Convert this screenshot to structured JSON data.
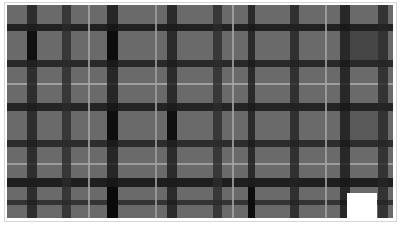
{
  "image": {
    "subject": "grayscale tartan plaid fabric",
    "background": "#ffffff",
    "border_color": "#d6d6d6",
    "base_color": "#6a6a6a",
    "vertical_bands": [
      {
        "x": 20,
        "w": 10,
        "color": "#1e1e1e"
      },
      {
        "x": 55,
        "w": 9,
        "color": "#2a2a2a"
      },
      {
        "x": 81,
        "w": 2,
        "color": "#a8a8a8"
      },
      {
        "x": 100,
        "w": 11,
        "color": "#151515"
      },
      {
        "x": 148,
        "w": 2,
        "color": "#a0a0a0"
      },
      {
        "x": 160,
        "w": 10,
        "color": "#1b1b1b"
      },
      {
        "x": 206,
        "w": 9,
        "color": "#2c2c2c"
      },
      {
        "x": 225,
        "w": 2,
        "color": "#a8a8a8"
      },
      {
        "x": 241,
        "w": 7,
        "color": "#1a1a1a"
      },
      {
        "x": 283,
        "w": 9,
        "color": "#222222"
      },
      {
        "x": 318,
        "w": 2,
        "color": "#a4a4a4"
      },
      {
        "x": 333,
        "w": 10,
        "color": "#181818"
      },
      {
        "x": 371,
        "w": 10,
        "color": "#262626"
      }
    ],
    "horizontal_bands": [
      {
        "y": 19,
        "h": 7,
        "color": "#141414"
      },
      {
        "y": 55,
        "h": 7,
        "color": "#1d1d1d"
      },
      {
        "y": 78,
        "h": 2,
        "color": "#a8a8a8"
      },
      {
        "y": 98,
        "h": 8,
        "color": "#171717"
      },
      {
        "y": 135,
        "h": 7,
        "color": "#222222"
      },
      {
        "y": 158,
        "h": 2,
        "color": "#a4a4a4"
      },
      {
        "y": 173,
        "h": 9,
        "color": "#111111"
      },
      {
        "y": 195,
        "h": 5,
        "color": "#2a2a2a"
      }
    ],
    "dark_blocks": [
      {
        "x": 20,
        "y": 26,
        "w": 10,
        "h": 29,
        "color": "#101010"
      },
      {
        "x": 100,
        "y": 26,
        "w": 11,
        "h": 29,
        "color": "#0c0c0c"
      },
      {
        "x": 100,
        "y": 106,
        "w": 11,
        "h": 29,
        "color": "#0e0e0e"
      },
      {
        "x": 160,
        "y": 106,
        "w": 10,
        "h": 29,
        "color": "#0f0f0f"
      },
      {
        "x": 100,
        "y": 182,
        "w": 11,
        "h": 31,
        "color": "#0a0a0a"
      },
      {
        "x": 241,
        "y": 182,
        "w": 7,
        "h": 31,
        "color": "#0d0d0d"
      }
    ],
    "solid_squares": [
      {
        "x": 343,
        "y": 26,
        "w": 28,
        "h": 29,
        "color": "#454545"
      },
      {
        "x": 343,
        "y": 106,
        "w": 28,
        "h": 29,
        "color": "#5a5a5a"
      },
      {
        "x": 340,
        "y": 188,
        "w": 30,
        "h": 25,
        "color": "#ffffff"
      }
    ]
  }
}
